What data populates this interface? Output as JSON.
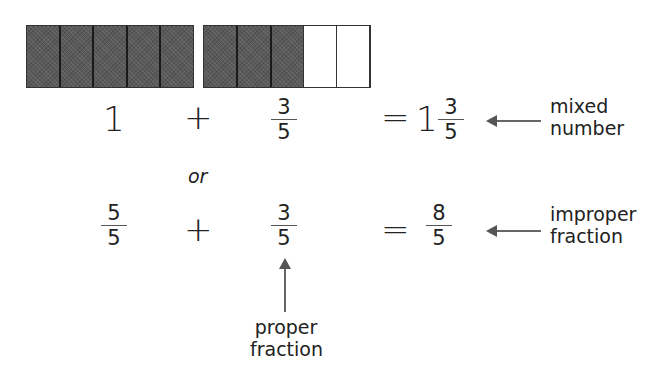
{
  "bars": [
    {
      "name": "whole-bar",
      "total_parts": 5,
      "shaded_parts": 5
    },
    {
      "name": "fraction-bar",
      "total_parts": 5,
      "shaded_parts": 3
    }
  ],
  "row1": {
    "term1": "1",
    "plus": "+",
    "term2": {
      "numerator": "3",
      "denominator": "5"
    },
    "equals": "=",
    "result": {
      "whole": "1",
      "numerator": "3",
      "denominator": "5"
    },
    "label_line1": "mixed",
    "label_line2": "number"
  },
  "separator": "or",
  "row2": {
    "term1": {
      "numerator": "5",
      "denominator": "5"
    },
    "plus": "+",
    "term2": {
      "numerator": "3",
      "denominator": "5"
    },
    "equals": "=",
    "result": {
      "numerator": "8",
      "denominator": "5"
    },
    "label_line1": "improper",
    "label_line2": "fraction"
  },
  "proper_label": {
    "line1": "proper",
    "line2": "fraction"
  }
}
